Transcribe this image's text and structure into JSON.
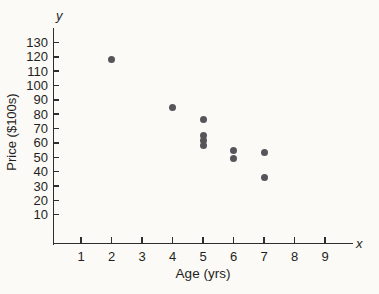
{
  "chart_data": {
    "type": "scatter",
    "title": "",
    "xlabel": "Age (yrs)",
    "ylabel": "Price ($100s)",
    "x_axis_letter": "x",
    "y_axis_letter": "y",
    "x_ticks": [
      1,
      2,
      3,
      4,
      5,
      6,
      7,
      8,
      9
    ],
    "y_ticks": [
      10,
      20,
      30,
      40,
      50,
      60,
      70,
      80,
      90,
      100,
      110,
      120,
      130
    ],
    "xlim": [
      0,
      10
    ],
    "ylim": [
      0,
      135
    ],
    "grid": false,
    "legend": null,
    "points": [
      {
        "x": 2,
        "y": 118
      },
      {
        "x": 4,
        "y": 85
      },
      {
        "x": 5,
        "y": 76
      },
      {
        "x": 5,
        "y": 65
      },
      {
        "x": 5,
        "y": 62
      },
      {
        "x": 5,
        "y": 58
      },
      {
        "x": 6,
        "y": 55
      },
      {
        "x": 6,
        "y": 49
      },
      {
        "x": 7,
        "y": 53
      },
      {
        "x": 7,
        "y": 36
      }
    ],
    "point_color": "#56565a",
    "axis_color": "#2e2e30",
    "background": "#fbfaf7"
  }
}
